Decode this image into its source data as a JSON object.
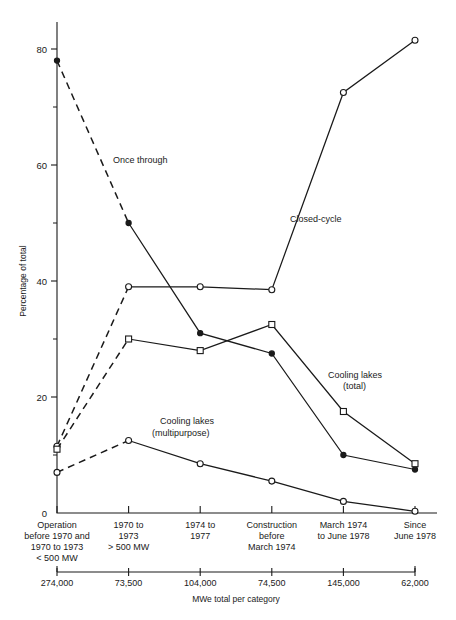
{
  "chart_data": {
    "type": "line",
    "title": "",
    "xlabel": "MWe total per category",
    "ylabel": "Percentage of total",
    "ylim": [
      0,
      85
    ],
    "yticks": [
      0,
      20,
      40,
      60,
      80
    ],
    "ytick_labels": [
      "0",
      "20",
      "40",
      "60",
      "80"
    ],
    "yminor_ticks": [
      10,
      30,
      50,
      70
    ],
    "grid": false,
    "legend_position": "inline-annotations",
    "categories": [
      "Operation before 1970 and 1970 to 1973 < 500 MW",
      "1970 to 1973 > 500 MW",
      "1974 to 1977",
      "Construction before March 1974",
      "March 1974 to June 1978",
      "Since June 1978"
    ],
    "category_lines": [
      [
        "Operation",
        "before 1970 and",
        "1970 to 1973",
        "< 500 MW"
      ],
      [
        "1970 to",
        "1973",
        "> 500 MW"
      ],
      [
        "1974 to",
        "1977"
      ],
      [
        "Construction",
        "before",
        "March 1974"
      ],
      [
        "March 1974",
        "to June 1978"
      ],
      [
        "Since",
        "June 1978"
      ]
    ],
    "secondary_axis_label": "MWe total per category",
    "secondary_axis_values": [
      "274,000",
      "73,500",
      "104,000",
      "74,500",
      "145,000",
      "62,000"
    ],
    "series": [
      {
        "name": "Once through",
        "marker": "filled-circle",
        "first_segment_dashed": true,
        "values": [
          78,
          50,
          31,
          27.5,
          10,
          7.5
        ]
      },
      {
        "name": "Closed-cycle",
        "marker": "open-circle",
        "first_segment_dashed": true,
        "values": [
          11.5,
          39,
          39,
          38.5,
          72.5,
          81.5
        ]
      },
      {
        "name": "Cooling lakes (total)",
        "marker": "open-square",
        "first_segment_dashed": true,
        "values": [
          11,
          30,
          28,
          32.5,
          17.5,
          8.5
        ]
      },
      {
        "name": "Cooling lakes (multipurpose)",
        "marker": "open-circle",
        "first_segment_dashed": true,
        "values": [
          7,
          12.5,
          8.5,
          5.5,
          2,
          0.3
        ]
      }
    ],
    "annotations": [
      {
        "text": "Once through",
        "x": 113,
        "y": 163
      },
      {
        "text": "Closed-cycle",
        "x": 290,
        "y": 222
      },
      {
        "text": "Cooling lakes",
        "x": 328,
        "y": 378
      },
      {
        "text": "(total)",
        "x": 343,
        "y": 389
      },
      {
        "text": "Cooling lakes",
        "x": 160,
        "y": 424
      },
      {
        "text": "(multipurpose)",
        "x": 152,
        "y": 436
      }
    ]
  }
}
